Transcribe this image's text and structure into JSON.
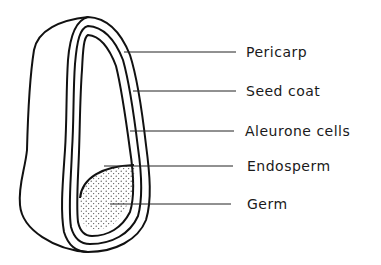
{
  "diagram": {
    "labels": [
      {
        "id": "pericarp",
        "text": "Pericarp",
        "y": 52
      },
      {
        "id": "seed-coat",
        "text": "Seed coat",
        "y": 91
      },
      {
        "id": "aleurone-cells",
        "text": "Aleurone cells",
        "y": 131
      },
      {
        "id": "endosperm",
        "text": "Endosperm",
        "y": 166
      },
      {
        "id": "germ",
        "text": "Germ",
        "y": 204
      }
    ],
    "colors": {
      "stroke": "#111111",
      "background": "#ffffff",
      "stipple": "#333333"
    }
  }
}
